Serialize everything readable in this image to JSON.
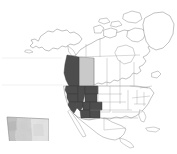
{
  "figure": {
    "type": "locator-map",
    "title": "",
    "background_color": "#ffffff",
    "width": 177,
    "height": 154
  },
  "main_map": {
    "name": "north-america-basemap",
    "projection_look": "lambert-conformal-conic",
    "outline_color": "#6e6e6e",
    "fill_color": "#ffffff",
    "internal_boundary_color": "#9a9a9a",
    "extent_description": "North America including Alaska, Canada, Greenland, conterminous United States, and Mexico",
    "highlight_classes": [
      {
        "id": "dark",
        "color": "#4d4d4d",
        "label": "Study area (dark gray)"
      },
      {
        "id": "light",
        "color": "#c9c9c9",
        "label": "Inset area (light gray)"
      },
      {
        "id": "none",
        "color": "#ffffff",
        "label": "Not highlighted"
      }
    ],
    "highlighted_dark": [
      "British Columbia",
      "Washington",
      "Oregon",
      "Idaho",
      "Montana",
      "Wyoming",
      "California",
      "Nevada",
      "Utah",
      "Colorado",
      "Arizona",
      "New Mexico"
    ],
    "highlighted_light": [
      "Alberta"
    ]
  },
  "inset_map": {
    "name": "alberta-raster-inset",
    "region_label": "Alberta",
    "border_color": "#8a8a8a",
    "raster_type": "grayscale",
    "value_range_light_to_dark": [
      "#f2f2f2",
      "#a9a9a9"
    ],
    "marker": {
      "name": "corner-marker",
      "color": "#1a1a1a",
      "position": "southwest-corner"
    }
  }
}
